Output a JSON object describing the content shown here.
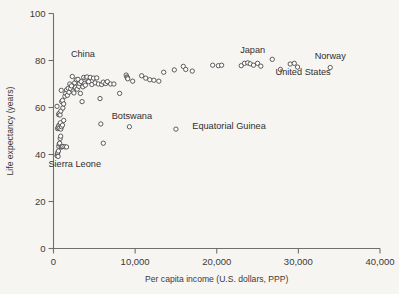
{
  "chart_data": {
    "type": "scatter",
    "title": "",
    "xlabel": "Per capita income (U.S. dollars, PPP)",
    "ylabel": "Life expectancy (years)",
    "xlim": [
      0,
      40000
    ],
    "ylim": [
      0,
      100
    ],
    "xticks": [
      0,
      10000,
      20000,
      30000,
      40000
    ],
    "xticklabels": [
      "0",
      "10,000",
      "20,000",
      "30,000",
      "40,000"
    ],
    "yticks": [
      0,
      20,
      40,
      60,
      80,
      100
    ],
    "yticklabels": [
      "0",
      "20",
      "40",
      "60",
      "80",
      "100"
    ],
    "grid": false,
    "legend": null,
    "marker": "open-circle",
    "marker_color": "#4a4a4a",
    "points": [
      [
        430,
        39.5
      ],
      [
        470,
        40.2
      ],
      [
        520,
        40.8
      ],
      [
        560,
        39.2
      ],
      [
        600,
        41.5
      ],
      [
        640,
        43.5
      ],
      [
        700,
        44.5
      ],
      [
        760,
        44.8
      ],
      [
        820,
        46.8
      ],
      [
        880,
        47.8
      ],
      [
        950,
        43.2
      ],
      [
        1050,
        43.3
      ],
      [
        1150,
        43.4
      ],
      [
        1400,
        43.3
      ],
      [
        1600,
        43.2
      ],
      [
        500,
        51.0
      ],
      [
        560,
        51.5
      ],
      [
        620,
        52.2
      ],
      [
        700,
        51.2
      ],
      [
        780,
        52.8
      ],
      [
        850,
        53.5
      ],
      [
        900,
        50.8
      ],
      [
        980,
        51.8
      ],
      [
        1100,
        52.5
      ],
      [
        1250,
        54.5
      ],
      [
        430,
        60.5
      ],
      [
        620,
        57.0
      ],
      [
        700,
        57.5
      ],
      [
        800,
        56.8
      ],
      [
        900,
        58.5
      ],
      [
        1000,
        62.5
      ],
      [
        1100,
        63.0
      ],
      [
        1150,
        59.8
      ],
      [
        1250,
        61.5
      ],
      [
        1400,
        64.8
      ],
      [
        1500,
        66.0
      ],
      [
        1600,
        67.5
      ],
      [
        950,
        67.3
      ],
      [
        1700,
        65.2
      ],
      [
        1800,
        68.2
      ],
      [
        1900,
        66.5
      ],
      [
        2000,
        70.0
      ],
      [
        2100,
        68.0
      ],
      [
        2200,
        69.2
      ],
      [
        2300,
        73.2
      ],
      [
        2400,
        67.0
      ],
      [
        2500,
        66.2
      ],
      [
        2600,
        70.5
      ],
      [
        2700,
        68.5
      ],
      [
        2800,
        71.8
      ],
      [
        2900,
        67.8
      ],
      [
        3000,
        72.0
      ],
      [
        3100,
        69.0
      ],
      [
        3200,
        70.2
      ],
      [
        3300,
        66.0
      ],
      [
        3400,
        71.0
      ],
      [
        3500,
        62.5
      ],
      [
        3600,
        68.8
      ],
      [
        3700,
        72.8
      ],
      [
        3800,
        70.2
      ],
      [
        3900,
        69.5
      ],
      [
        4000,
        72.5
      ],
      [
        4100,
        73.0
      ],
      [
        4300,
        71.0
      ],
      [
        4500,
        72.8
      ],
      [
        4700,
        69.8
      ],
      [
        4900,
        72.5
      ],
      [
        5100,
        70.5
      ],
      [
        5300,
        72.6
      ],
      [
        5500,
        70.0
      ],
      [
        5700,
        63.8
      ],
      [
        5900,
        69.8
      ],
      [
        6100,
        70.8
      ],
      [
        6400,
        70.2
      ],
      [
        6600,
        71.0
      ],
      [
        7000,
        70.0
      ],
      [
        7400,
        70.0
      ],
      [
        8100,
        66.0
      ],
      [
        5800,
        53.0
      ],
      [
        6100,
        44.8
      ],
      [
        8900,
        73.8
      ],
      [
        9000,
        73.0
      ],
      [
        9050,
        72.6
      ],
      [
        9100,
        72.2
      ],
      [
        9700,
        71.2
      ],
      [
        10800,
        73.5
      ],
      [
        11300,
        72.5
      ],
      [
        11800,
        71.8
      ],
      [
        12300,
        71.6
      ],
      [
        12900,
        71.2
      ],
      [
        13500,
        75.0
      ],
      [
        14800,
        76.0
      ],
      [
        15900,
        77.5
      ],
      [
        16200,
        76.2
      ],
      [
        17000,
        75.5
      ],
      [
        19500,
        78.0
      ],
      [
        20200,
        77.8
      ],
      [
        20600,
        78.0
      ],
      [
        23000,
        77.8
      ],
      [
        23400,
        78.8
      ],
      [
        23800,
        79.0
      ],
      [
        24100,
        78.6
      ],
      [
        24500,
        78.0
      ],
      [
        25000,
        78.8
      ],
      [
        25400,
        77.6
      ],
      [
        26800,
        80.5
      ],
      [
        27800,
        76.2
      ],
      [
        29000,
        78.5
      ],
      [
        29500,
        78.8
      ],
      [
        29900,
        77.2
      ],
      [
        9300,
        51.8
      ],
      [
        15000,
        50.8
      ],
      [
        33900,
        77.0
      ]
    ],
    "annotations": [
      {
        "label": "China",
        "x": 3600,
        "y": 81.5,
        "anchor": "middle"
      },
      {
        "label": "Sierra Leone",
        "x": 2600,
        "y": 34.5,
        "anchor": "middle"
      },
      {
        "label": "Botswana",
        "x": 9600,
        "y": 55.0,
        "anchor": "middle"
      },
      {
        "label": "Equatorial Guinea",
        "x": 17000,
        "y": 50.8,
        "anchor": "start"
      },
      {
        "label": "Japan",
        "x": 24400,
        "y": 83.0,
        "anchor": "middle"
      },
      {
        "label": "Norway",
        "x": 33900,
        "y": 80.8,
        "anchor": "middle"
      },
      {
        "label": "United States",
        "x": 27200,
        "y": 73.8,
        "anchor": "start"
      }
    ]
  }
}
